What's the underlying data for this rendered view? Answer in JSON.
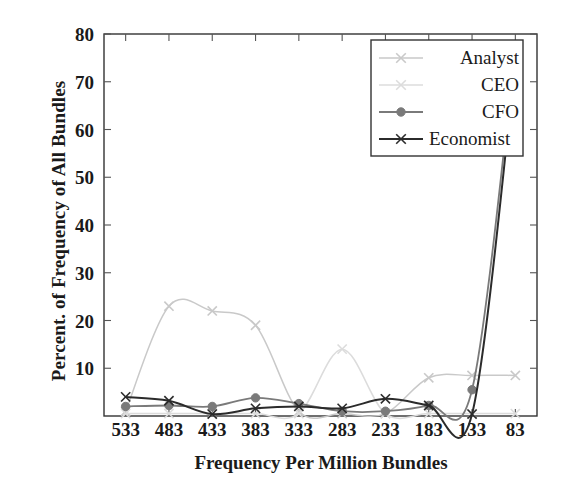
{
  "chart_data": {
    "type": "line",
    "title": "",
    "xlabel": "Frequency Per Million Bundles",
    "ylabel": "Percent. of Frequency of All Bundles",
    "categories": [
      "533",
      "483",
      "433",
      "383",
      "333",
      "283",
      "233",
      "183",
      "133",
      "83"
    ],
    "xticklabels": [
      "533",
      "483",
      "433",
      "383",
      "333",
      "283",
      "233",
      "183",
      "133",
      "83"
    ],
    "yticklabels": [
      "10",
      "20",
      "30",
      "40",
      "50",
      "60",
      "70",
      "80"
    ],
    "ytickvalues": [
      10,
      20,
      30,
      40,
      50,
      60,
      70,
      80
    ],
    "ylim": [
      0,
      80
    ],
    "grid": false,
    "legend_position": "upper right",
    "series": [
      {
        "name": "Analyst",
        "color": "#c9c9c9",
        "marker": "x",
        "values": [
          1.0,
          23.0,
          22.0,
          19.0,
          1.0,
          0.5,
          0.5,
          8.0,
          8.5,
          8.5
        ]
      },
      {
        "name": "CEO",
        "color": "#dcdcdc",
        "marker": "x",
        "values": [
          0.5,
          0.5,
          0.5,
          0.5,
          0.5,
          14.0,
          0.5,
          0.5,
          0.5,
          0.5
        ]
      },
      {
        "name": "CFO",
        "color": "#7a7a7a",
        "marker": "o",
        "values": [
          2.0,
          2.2,
          2.0,
          3.8,
          2.6,
          1.0,
          1.0,
          2.2,
          5.5,
          77.0
        ]
      },
      {
        "name": "Economist",
        "color": "#2b2b2b",
        "marker": "x",
        "values": [
          4.0,
          3.2,
          0.4,
          1.6,
          2.0,
          1.6,
          3.6,
          2.2,
          0.4,
          74.0
        ]
      }
    ]
  },
  "axes": {
    "frame_color": "#333333",
    "tick_color": "#555555"
  },
  "legend": {
    "entries": [
      "Analyst",
      "CEO",
      "CFO",
      "Economist"
    ]
  }
}
